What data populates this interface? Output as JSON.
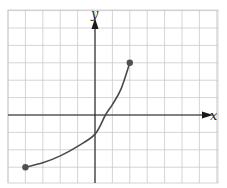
{
  "chart_data": {
    "type": "line",
    "title": "",
    "xlabel": "x",
    "ylabel": "y",
    "xlim": [
      -5,
      7
    ],
    "ylim": [
      -4,
      6
    ],
    "grid": true,
    "grid_step": 1,
    "tick_labels": false,
    "series": [
      {
        "name": "graph of f",
        "x": [
          -4,
          -3,
          -2,
          -1,
          0,
          0.6,
          1,
          1.5,
          2
        ],
        "y": [
          -3,
          -2.75,
          -2.35,
          -1.8,
          -1.1,
          0,
          0.6,
          1.5,
          3
        ],
        "endpoints": [
          {
            "x": -4,
            "y": -3,
            "closed": true
          },
          {
            "x": 2,
            "y": 3,
            "closed": true
          }
        ]
      }
    ]
  },
  "axes": {
    "x_label": "x",
    "y_label": "y"
  },
  "colors": {
    "grid": "#c9c9c9",
    "axis": "#1a1a1a",
    "curve": "#4a4a4a",
    "endpoint": "#505050"
  }
}
